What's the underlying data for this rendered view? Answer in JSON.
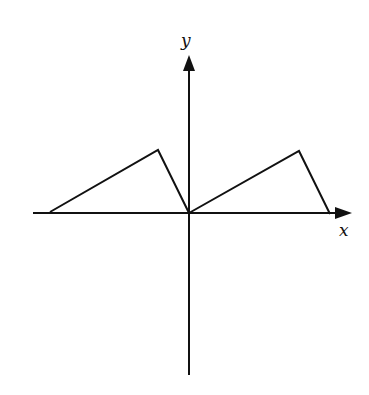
{
  "diagram": {
    "type": "function-graph",
    "axes": {
      "x_label": "x",
      "y_label": "y",
      "origin_px": [
        189,
        213
      ],
      "x_axis_px": {
        "from": 33,
        "to": 352
      },
      "y_axis_px": {
        "from": 375,
        "to": 55
      }
    },
    "curves": [
      {
        "name": "left-sawtooth",
        "points_px": [
          [
            50,
            212
          ],
          [
            158,
            150
          ],
          [
            189,
            213
          ]
        ]
      },
      {
        "name": "right-sawtooth",
        "points_px": [
          [
            189,
            213
          ],
          [
            299,
            151
          ],
          [
            330,
            214
          ]
        ]
      }
    ],
    "colors": {
      "stroke": "#111111",
      "background": "#ffffff"
    }
  }
}
